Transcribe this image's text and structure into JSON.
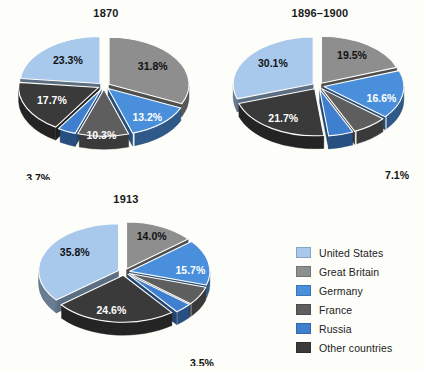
{
  "colors": {
    "united_states": "#a8c8ec",
    "great_britain": "#8e8e8e",
    "germany": "#4a8fdc",
    "france": "#5e5e5e",
    "russia": "#3f7fd0",
    "other_countries": "#3a3a3a",
    "background": "#fdfdfa",
    "label_dark": "#111111",
    "label_light": "#ffffff"
  },
  "legend": {
    "items": [
      {
        "label": "United States",
        "key": "united_states",
        "color": "#a8c8ec"
      },
      {
        "label": "Great Britain",
        "key": "great_britain",
        "color": "#8e8e8e"
      },
      {
        "label": "Germany",
        "key": "germany",
        "color": "#4a8fdc"
      },
      {
        "label": "France",
        "key": "france",
        "color": "#5e5e5e"
      },
      {
        "label": "Russia",
        "key": "russia",
        "color": "#3f7fd0"
      },
      {
        "label": "Other countries",
        "key": "other_countries",
        "color": "#3a3a3a"
      }
    ]
  },
  "chart_data": [
    {
      "type": "pie",
      "title": "1870",
      "exploded": true,
      "three_d": true,
      "categories": [
        "Great Britain",
        "Germany",
        "France",
        "Russia",
        "Other countries",
        "United States"
      ],
      "values": [
        31.8,
        13.2,
        10.3,
        3.7,
        17.7,
        23.3
      ],
      "labels": [
        "31.8%",
        "13.2%",
        "10.3%",
        "3.7%",
        "17.7%",
        "23.3%"
      ],
      "colors": [
        "#8e8e8e",
        "#4a8fdc",
        "#5e5e5e",
        "#3f7fd0",
        "#3a3a3a",
        "#a8c8ec"
      ],
      "label_colors": [
        "#111111",
        "#ffffff",
        "#ffffff",
        "#111111",
        "#ffffff",
        "#111111"
      ],
      "legend_position": "right"
    },
    {
      "type": "pie",
      "title": "1896–1900",
      "exploded": true,
      "three_d": true,
      "categories": [
        "Great Britain",
        "Germany",
        "France",
        "Russia",
        "Other countries",
        "United States"
      ],
      "values": [
        19.5,
        16.6,
        7.1,
        5.0,
        21.7,
        30.1
      ],
      "labels": [
        "19.5%",
        "16.6%",
        "7.1%",
        "5.0%",
        "21.7%",
        "30.1%"
      ],
      "colors": [
        "#8e8e8e",
        "#4a8fdc",
        "#5e5e5e",
        "#3f7fd0",
        "#3a3a3a",
        "#a8c8ec"
      ],
      "label_colors": [
        "#111111",
        "#ffffff",
        "#111111",
        "#111111",
        "#ffffff",
        "#111111"
      ],
      "legend_position": "right"
    },
    {
      "type": "pie",
      "title": "1913",
      "exploded": true,
      "three_d": true,
      "categories": [
        "Great Britain",
        "Germany",
        "France",
        "Russia",
        "Other countries",
        "United States"
      ],
      "values": [
        14.0,
        15.7,
        6.4,
        3.5,
        24.6,
        35.8
      ],
      "labels": [
        "14.0%",
        "15.7%",
        "6.4%",
        "3.5%",
        "24.6%",
        "35.8%"
      ],
      "colors": [
        "#8e8e8e",
        "#4a8fdc",
        "#5e5e5e",
        "#3f7fd0",
        "#3a3a3a",
        "#a8c8ec"
      ],
      "label_colors": [
        "#111111",
        "#ffffff",
        "#111111",
        "#111111",
        "#ffffff",
        "#111111"
      ],
      "legend_position": "right"
    }
  ]
}
